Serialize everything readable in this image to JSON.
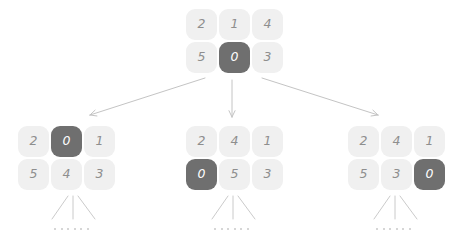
{
  "diagram": {
    "colors": {
      "tile_light_bg": "#f0f0f0",
      "tile_light_text": "#8e8e8e",
      "tile_dark_bg": "#6f6f6f",
      "tile_dark_text": "#ffffff",
      "edge": "#c4c4c4",
      "dot": "#c9c9c9",
      "background": "#ffffff"
    },
    "nodes": [
      {
        "id": "root",
        "name": "root-puzzle",
        "x": 186,
        "y": 9,
        "rows": [
          [
            {
              "value": "2",
              "state": "light"
            },
            {
              "value": "1",
              "state": "light"
            },
            {
              "value": "4",
              "state": "light"
            }
          ],
          [
            {
              "value": "5",
              "state": "light"
            },
            {
              "value": "0",
              "state": "dark"
            },
            {
              "value": "3",
              "state": "light"
            }
          ]
        ]
      },
      {
        "id": "child-left",
        "name": "child-puzzle-left",
        "x": 18,
        "y": 126,
        "rows": [
          [
            {
              "value": "2",
              "state": "light"
            },
            {
              "value": "0",
              "state": "dark"
            },
            {
              "value": "1",
              "state": "light"
            }
          ],
          [
            {
              "value": "5",
              "state": "light"
            },
            {
              "value": "4",
              "state": "light"
            },
            {
              "value": "3",
              "state": "light"
            }
          ]
        ]
      },
      {
        "id": "child-middle",
        "name": "child-puzzle-middle",
        "x": 186,
        "y": 126,
        "rows": [
          [
            {
              "value": "2",
              "state": "light"
            },
            {
              "value": "4",
              "state": "light"
            },
            {
              "value": "1",
              "state": "light"
            }
          ],
          [
            {
              "value": "0",
              "state": "dark"
            },
            {
              "value": "5",
              "state": "light"
            },
            {
              "value": "3",
              "state": "light"
            }
          ]
        ]
      },
      {
        "id": "child-right",
        "name": "child-puzzle-right",
        "x": 348,
        "y": 126,
        "rows": [
          [
            {
              "value": "2",
              "state": "light"
            },
            {
              "value": "4",
              "state": "light"
            },
            {
              "value": "1",
              "state": "light"
            }
          ],
          [
            {
              "value": "5",
              "state": "light"
            },
            {
              "value": "3",
              "state": "light"
            },
            {
              "value": "0",
              "state": "dark"
            }
          ]
        ]
      }
    ],
    "edges": [
      {
        "name": "edge-root-to-left",
        "x1": 205,
        "y1": 78,
        "x2": 90,
        "y2": 115,
        "arrowhead": true
      },
      {
        "name": "edge-root-to-middle",
        "x1": 232,
        "y1": 80,
        "x2": 232,
        "y2": 117,
        "arrowhead": true
      },
      {
        "name": "edge-root-to-right",
        "x1": 262,
        "y1": 78,
        "x2": 378,
        "y2": 115,
        "arrowhead": true
      }
    ],
    "frontier_groups": [
      {
        "name": "frontier-left",
        "lines": [
          {
            "x1": 68,
            "y1": 196,
            "x2": 52,
            "y2": 219
          },
          {
            "x1": 73,
            "y1": 196,
            "x2": 73,
            "y2": 219
          },
          {
            "x1": 78,
            "y1": 196,
            "x2": 95,
            "y2": 219
          }
        ],
        "dots_x": 54,
        "dots_y": 228,
        "dot_count": 6
      },
      {
        "name": "frontier-middle",
        "lines": [
          {
            "x1": 228,
            "y1": 196,
            "x2": 212,
            "y2": 219
          },
          {
            "x1": 233,
            "y1": 196,
            "x2": 233,
            "y2": 219
          },
          {
            "x1": 238,
            "y1": 196,
            "x2": 255,
            "y2": 219
          }
        ],
        "dots_x": 214,
        "dots_y": 228,
        "dot_count": 6
      },
      {
        "name": "frontier-right",
        "lines": [
          {
            "x1": 390,
            "y1": 196,
            "x2": 374,
            "y2": 219
          },
          {
            "x1": 395,
            "y1": 196,
            "x2": 395,
            "y2": 219
          },
          {
            "x1": 400,
            "y1": 196,
            "x2": 417,
            "y2": 219
          }
        ],
        "dots_x": 376,
        "dots_y": 228,
        "dot_count": 6
      }
    ]
  }
}
